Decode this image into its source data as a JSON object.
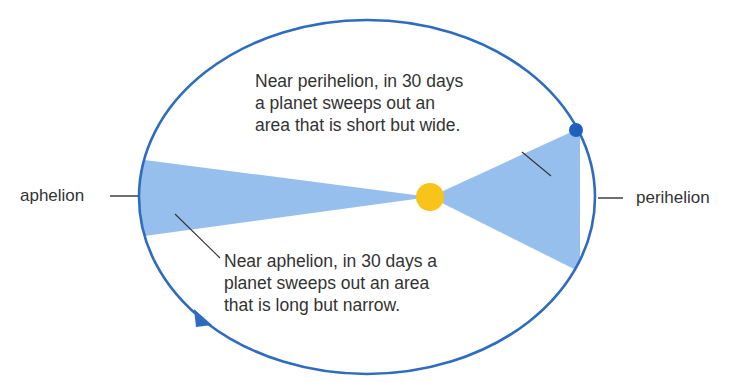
{
  "diagram": {
    "labels": {
      "aphelion": "aphelion",
      "perihelion": "perihelion"
    },
    "callouts": {
      "perihelion_note": {
        "lines": [
          "Near perihelion, in 30 days",
          "a planet sweeps out an",
          "area that is short but wide."
        ]
      },
      "aphelion_note": {
        "lines": [
          "Near aphelion, in 30 days a",
          "planet sweeps out an area",
          "that is long but narrow."
        ]
      }
    },
    "colors": {
      "orbit": "#2e6cc0",
      "wedge": "#97bfee",
      "sun": "#f9c41a",
      "planet": "#1f5fbf",
      "leader_line": "#333333",
      "text": "#333333"
    },
    "elements": {
      "sun": "sun-icon",
      "planet": "planet-icon",
      "orbit_direction": "arrowhead-icon"
    }
  }
}
